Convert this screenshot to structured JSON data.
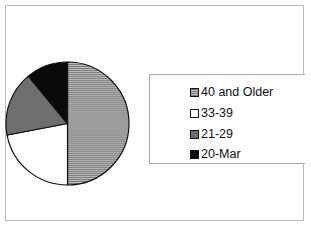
{
  "chart_data": {
    "type": "pie",
    "title": "",
    "categories": [
      "40 and Older",
      "33-39",
      "21-29",
      "20-Mar"
    ],
    "values": [
      50,
      22,
      17,
      11
    ],
    "unit": "percent (estimated)",
    "colors": [
      "#9a9a9a",
      "#ffffff",
      "#6e6e6e",
      "#0a0a0a"
    ],
    "patterns": [
      "horizontal-lines",
      "solid",
      "solid",
      "solid"
    ],
    "legend_position": "right",
    "start_angle_deg": 0,
    "direction": "clockwise"
  },
  "legend": {
    "items": [
      {
        "label": "40 and Older",
        "color": "#9a9a9a"
      },
      {
        "label": "33-39",
        "color": "#ffffff"
      },
      {
        "label": "21-29",
        "color": "#6e6e6e"
      },
      {
        "label": "20-Mar",
        "color": "#0a0a0a"
      }
    ]
  }
}
